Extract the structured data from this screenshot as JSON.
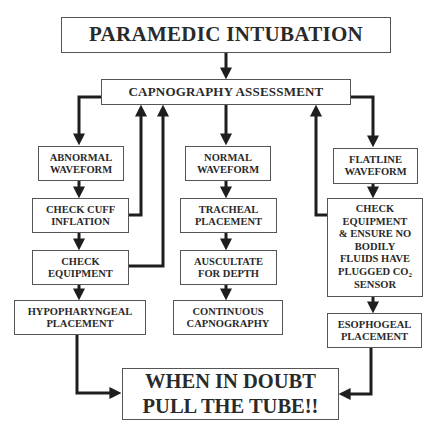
{
  "diagram": {
    "title": "PARAMEDIC INTUBATION",
    "assessment": "CAPNOGRAPHY ASSESSMENT",
    "left_branch": {
      "waveform": [
        "ABNORMAL",
        "WAVEFORM"
      ],
      "step1": [
        "CHECK CUFF",
        "INFLATION"
      ],
      "step2": [
        "CHECK",
        "EQUIPMENT"
      ],
      "result": [
        "HYPOPHARYNGEAL",
        "PLACEMENT"
      ]
    },
    "center_branch": {
      "waveform": [
        "NORMAL",
        "WAVEFORM"
      ],
      "step1": [
        "TRACHEAL",
        "PLACEMENT"
      ],
      "step2": [
        "AUSCULTATE",
        "FOR DEPTH"
      ],
      "result": [
        "CONTINUOUS",
        "CAPNOGRAPHY"
      ]
    },
    "right_branch": {
      "waveform": [
        "FLATLINE",
        "WAVEFORM"
      ],
      "step1": [
        "CHECK",
        "EQUIPMENT",
        "& ENSURE NO",
        "BODILY",
        "FLUIDS HAVE",
        "PLUGGED CO",
        "SENSOR"
      ],
      "step1_subscript": "2",
      "result": [
        "ESOPHOGEAL",
        "PLACEMENT"
      ]
    },
    "conclusion": [
      "WHEN IN DOUBT",
      "PULL THE TUBE!!"
    ],
    "colors": {
      "line": "#1e1e1e",
      "border": "#555555",
      "text": "#2a2a2a"
    }
  }
}
